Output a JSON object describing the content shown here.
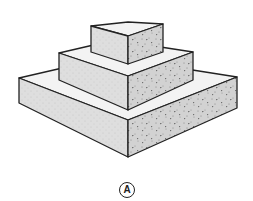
{
  "figure": {
    "label": "A",
    "colors": {
      "outline": "#222222",
      "top_face": "#f2f2f2",
      "left_face": "#dcdcdc",
      "right_face": "#d0d0d0",
      "speckle": "#555555"
    },
    "tiers": [
      {
        "name": "top-block"
      },
      {
        "name": "middle-slab"
      },
      {
        "name": "bottom-slab"
      }
    ]
  }
}
